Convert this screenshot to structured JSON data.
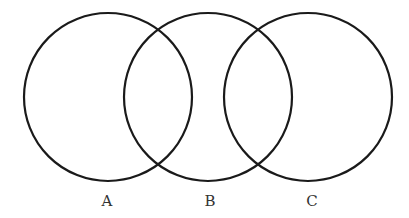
{
  "diagram": {
    "type": "venn",
    "stroke_color": "#1a1a1a",
    "circles": [
      {
        "id": "A",
        "label": "A",
        "cx": 108,
        "cy": 97,
        "r": 84
      },
      {
        "id": "B",
        "label": "B",
        "cx": 208,
        "cy": 97,
        "r": 84
      },
      {
        "id": "C",
        "label": "C",
        "cx": 308,
        "cy": 97,
        "r": 84
      }
    ]
  }
}
